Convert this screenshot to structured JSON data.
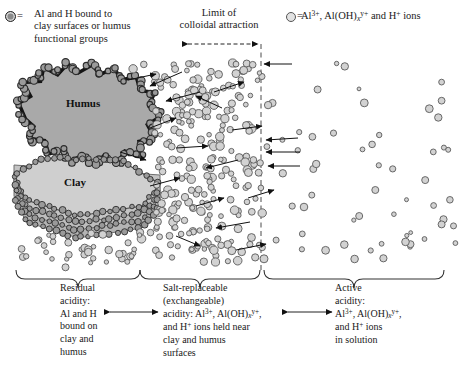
{
  "legend": {
    "left": {
      "symbol": "filled-dark-circle",
      "equals": "=",
      "line1": "Al and H bound to",
      "line2": "clay surfaces or humus",
      "line3": "functional groups"
    },
    "right": {
      "symbol": "open-light-circle",
      "equals": "=",
      "text": "Al3+, Al(OH)xy+ and H+ ions"
    }
  },
  "annotations": {
    "limit_line1": "Limit of",
    "limit_line2": "colloidal attraction"
  },
  "particles": {
    "humus_label": "Humus",
    "clay_label": "Clay"
  },
  "captions": {
    "residual": {
      "title_line1": "Residual",
      "title_line2": "acidity:",
      "body_line1": "Al and H",
      "body_line2": "bound on",
      "body_line3": "clay and",
      "body_line4": "humus"
    },
    "salt_replaceable": {
      "title_line1": "Salt-replaceable",
      "title_line2": "(exchangeable)",
      "body_line1": "acidity: Al3+, Al(OH)xy+,",
      "body_line2": "and H+ ions held near",
      "body_line3": "clay and humus",
      "body_line4": "surfaces"
    },
    "active": {
      "title_line1": "Active",
      "title_line2": "acidity:",
      "body_line1": "Al3+, Al(OH)xy+,",
      "body_line2": "and H+ ions",
      "body_line3": "in solution"
    }
  },
  "colors": {
    "ion_fill": "#d2d2d2",
    "ion_stroke": "#5a5a5a",
    "bound_ion_fill": "#9a9a9a",
    "bound_ion_stroke": "#2b2b2b",
    "humus_fill": "#a9a9a9",
    "humus_border": "#141414",
    "clay_fill": "#c9c9c9",
    "clay_edge": "#9a9a9a",
    "line": "#222222"
  },
  "chart_data": {
    "type": "diagram",
    "zones": [
      {
        "name": "Residual acidity",
        "x_start": 14,
        "x_end": 137
      },
      {
        "name": "Salt-replaceable (exchangeable) acidity",
        "x_start": 137,
        "x_end": 257
      },
      {
        "name": "Active acidity",
        "x_start": 257,
        "x_end": 449
      }
    ],
    "limit_of_colloidal_attraction_x": 261
  }
}
